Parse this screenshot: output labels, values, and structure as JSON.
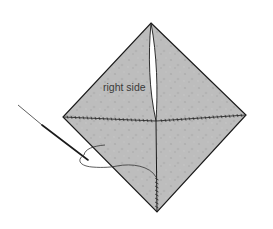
{
  "diagram": {
    "type": "sewing-illustration",
    "label": "right side",
    "colors": {
      "background": "#ffffff",
      "fabric": "#bdbdbd",
      "fabric_speckle": "#acacac",
      "outline": "#1a1a1a",
      "stitch": "#2a2a2a",
      "thread": "#333333",
      "needle": "#1a1a1a",
      "slit": "#ffffff",
      "label": "#3a3a3a"
    },
    "shape": {
      "top_apex": [
        151,
        23
      ],
      "left_corner": [
        63,
        117
      ],
      "right_corner": [
        246,
        115
      ],
      "bottom_apex": [
        157,
        212
      ],
      "center": [
        156,
        121
      ]
    },
    "elements": [
      {
        "name": "fabric-diamond",
        "description": "Gray fabric square folded into a diamond, right side facing up"
      },
      {
        "name": "center-slit",
        "description": "White opening running from top apex down to center"
      },
      {
        "name": "horizontal-seam",
        "description": "Stitched seam across the middle from left corner to right corner"
      },
      {
        "name": "vertical-seam",
        "description": "Stitched seam from center thread exit down to bottom apex"
      },
      {
        "name": "needle",
        "description": "Sewing needle entering at left side"
      },
      {
        "name": "thread",
        "description": "Thread looping from needle eye to the vertical seam"
      }
    ]
  }
}
